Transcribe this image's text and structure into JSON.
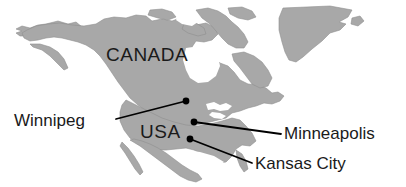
{
  "figure": {
    "type": "map",
    "region": "North America",
    "projection_note": "continental outline, grayscale",
    "width": 406,
    "height": 187
  },
  "colors": {
    "background": "#ffffff",
    "land": "#a8a8a8",
    "land_outline": "#8f8f8f",
    "water": "#ffffff",
    "marker": "#000000",
    "leader_line": "#000000",
    "text": "#1a1a1a"
  },
  "country_labels": [
    {
      "name": "canada",
      "text": "CANADA"
    },
    {
      "name": "usa",
      "text": "USA"
    }
  ],
  "cities": [
    {
      "name": "winnipeg",
      "label": "Winnipeg",
      "marker": {
        "x": 186,
        "y": 101
      },
      "label_side": "left",
      "leader_from": {
        "x": 116,
        "y": 119
      },
      "leader_to": {
        "x": 186,
        "y": 101
      }
    },
    {
      "name": "minneapolis",
      "label": "Minneapolis",
      "marker": {
        "x": 194,
        "y": 122
      },
      "label_side": "right",
      "leader_from": {
        "x": 194,
        "y": 122
      },
      "leader_to": {
        "x": 281,
        "y": 134
      }
    },
    {
      "name": "kansas-city",
      "label": "Kansas City",
      "marker": {
        "x": 190,
        "y": 139
      },
      "label_side": "right",
      "leader_from": {
        "x": 190,
        "y": 139
      },
      "leader_to": {
        "x": 252,
        "y": 163
      }
    }
  ],
  "landmasses": [
    {
      "name": "greenland"
    },
    {
      "name": "alaska"
    },
    {
      "name": "canada-mainland"
    },
    {
      "name": "arctic-archipelago"
    },
    {
      "name": "continental-usa"
    },
    {
      "name": "mexico"
    },
    {
      "name": "baja-california"
    },
    {
      "name": "great-lakes"
    },
    {
      "name": "hudson-bay"
    }
  ]
}
